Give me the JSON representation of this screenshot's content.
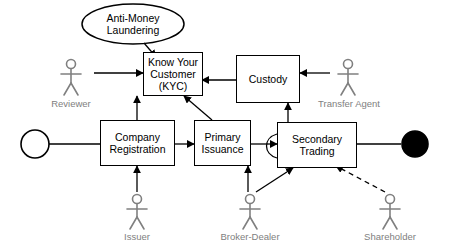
{
  "diagram": {
    "colors": {
      "stroke": "#000000",
      "actor": "#808080",
      "fill": "#ffffff",
      "terminator_end": "#000000"
    },
    "nodes": [
      {
        "id": "aml",
        "label": "Anti-Money Laundering",
        "shape": "ellipse"
      },
      {
        "id": "kyc",
        "label": "Know Your Customer (KYC)",
        "shape": "rect"
      },
      {
        "id": "custody",
        "label": "Custody",
        "shape": "rect"
      },
      {
        "id": "company_registration",
        "label": "Company Registration",
        "shape": "rect"
      },
      {
        "id": "primary_issuance",
        "label": "Primary Issuance",
        "shape": "rect"
      },
      {
        "id": "secondary_trading",
        "label": "Secondary Trading",
        "shape": "rect"
      },
      {
        "id": "start",
        "label": "",
        "shape": "circle-open"
      },
      {
        "id": "end",
        "label": "",
        "shape": "circle-filled"
      }
    ],
    "actors": [
      {
        "id": "reviewer",
        "label": "Reviewer"
      },
      {
        "id": "transfer_agent",
        "label": "Transfer Agent"
      },
      {
        "id": "issuer",
        "label": "Issuer"
      },
      {
        "id": "broker_dealer",
        "label": "Broker-Dealer"
      },
      {
        "id": "shareholder",
        "label": "Shareholder"
      }
    ],
    "edges": [
      {
        "from": "aml",
        "to": "kyc",
        "style": "solid-arrow"
      },
      {
        "from": "reviewer",
        "to": "kyc",
        "style": "solid-arrow"
      },
      {
        "from": "custody",
        "to": "kyc",
        "style": "solid-arrow"
      },
      {
        "from": "transfer_agent",
        "to": "custody",
        "style": "solid-arrow"
      },
      {
        "from": "start",
        "to": "company_registration",
        "style": "solid-line"
      },
      {
        "from": "company_registration",
        "to": "primary_issuance",
        "style": "solid-arrow"
      },
      {
        "from": "primary_issuance",
        "to": "secondary_trading",
        "style": "solid-arrow"
      },
      {
        "from": "secondary_trading",
        "to": "end",
        "style": "solid-line"
      },
      {
        "from": "company_registration",
        "to": "kyc",
        "style": "solid-arrow"
      },
      {
        "from": "primary_issuance",
        "to": "kyc",
        "style": "solid-arrow"
      },
      {
        "from": "secondary_trading",
        "to": "custody",
        "style": "solid-arrow"
      },
      {
        "from": "secondary_trading",
        "to": "secondary_trading",
        "style": "self-loop"
      },
      {
        "from": "issuer",
        "to": "company_registration",
        "style": "solid-arrow"
      },
      {
        "from": "broker_dealer",
        "to": "primary_issuance",
        "style": "solid-arrow"
      },
      {
        "from": "broker_dealer",
        "to": "secondary_trading",
        "style": "solid-arrow"
      },
      {
        "from": "shareholder",
        "to": "secondary_trading",
        "style": "dashed-arrow"
      }
    ]
  }
}
